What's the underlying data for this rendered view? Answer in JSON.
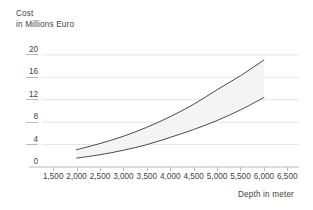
{
  "chart_data": {
    "type": "area",
    "title": "",
    "ylabel_line1": "Cost",
    "ylabel_line2": "in Millions Euro",
    "xlabel": "Depth in meter",
    "xlim": [
      1250,
      6750
    ],
    "ylim": [
      0,
      21.5
    ],
    "xticks": [
      1500,
      2000,
      2500,
      3000,
      3500,
      4000,
      4500,
      5000,
      5500,
      6000,
      6500
    ],
    "xtick_labels": [
      "1,500",
      "2,000",
      "2,500",
      "3,000",
      "3,500",
      "4,000",
      "4,500",
      "5,000",
      "5,500",
      "6,000",
      "6,500"
    ],
    "yticks": [
      0,
      4,
      8,
      12,
      16,
      20
    ],
    "ytick_labels": [
      "0",
      "4",
      "8",
      "12",
      "16",
      "20"
    ],
    "grid": "horizontal",
    "legend": "none",
    "x": [
      2000,
      2500,
      3000,
      3500,
      4000,
      4500,
      5000,
      5500,
      6000
    ],
    "series": [
      {
        "name": "upper-bound",
        "values": [
          3.0,
          4.1,
          5.4,
          7.0,
          8.9,
          11.1,
          13.7,
          16.2,
          19.0
        ]
      },
      {
        "name": "lower-bound",
        "values": [
          1.5,
          2.1,
          2.9,
          3.9,
          5.2,
          6.6,
          8.2,
          10.1,
          12.3
        ]
      }
    ],
    "band_fill_color": "#f4f4f4",
    "line_color": "#4a4a4a",
    "grid_color": "#e3e3e3",
    "axis_color": "#b9b9b9",
    "background_color": "#ffffff"
  }
}
